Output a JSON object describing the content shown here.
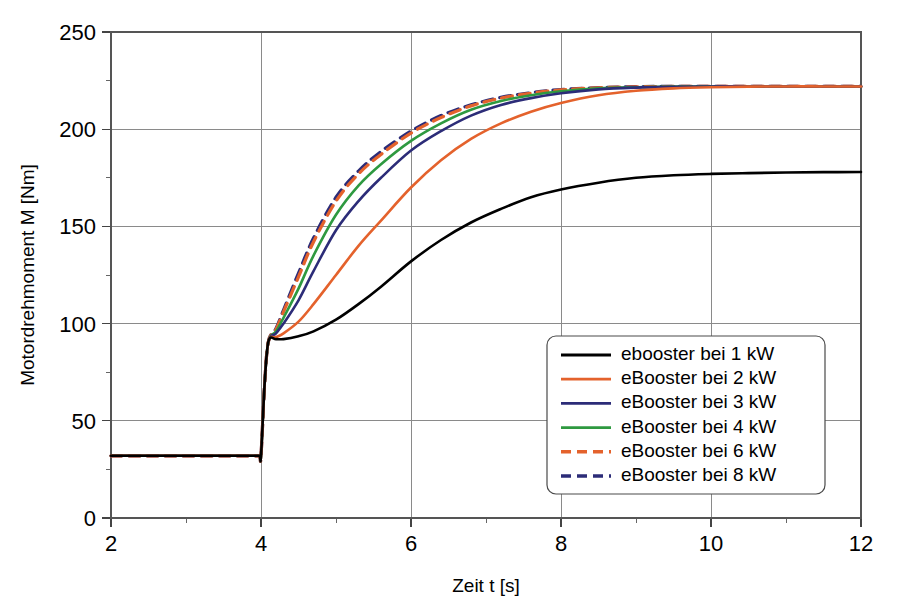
{
  "chart_data": {
    "type": "line",
    "title": "",
    "xlabel": "Zeit t [s]",
    "ylabel": "Motordrehmoment M [Nm]",
    "xlim": [
      2,
      12
    ],
    "ylim": [
      0,
      250
    ],
    "xticks": [
      "2",
      "4",
      "6",
      "8",
      "10",
      "12"
    ],
    "xtick_values": [
      2,
      4,
      6,
      8,
      10,
      12
    ],
    "xminor_values": [
      3,
      5,
      7,
      9,
      11
    ],
    "yticks": [
      "0",
      "50",
      "100",
      "150",
      "200",
      "250"
    ],
    "ytick_values": [
      0,
      50,
      100,
      150,
      200,
      250
    ],
    "yminor_values": [
      25,
      75,
      125,
      175,
      225
    ],
    "grid": true,
    "legend_position": "lower-right",
    "baseline_value": 32,
    "step_time": 4.0,
    "step_peak_value": 92,
    "series": [
      {
        "name": "ebooster bei 1 kW",
        "color": "#000000",
        "dash": "solid",
        "x": [
          2.0,
          2.5,
          3.0,
          3.5,
          3.9,
          3.98,
          4.0,
          4.05,
          4.1,
          4.2,
          4.3,
          4.5,
          4.7,
          5.0,
          5.3,
          5.6,
          6.0,
          6.4,
          6.8,
          7.2,
          7.6,
          8.0,
          8.5,
          9.0,
          9.5,
          10.0,
          10.5,
          11.0,
          11.5,
          12.0
        ],
        "y": [
          32,
          32,
          32,
          32,
          32,
          32,
          32,
          70,
          91,
          92,
          92,
          93.5,
          96,
          102,
          110,
          119,
          132,
          143,
          152,
          159,
          165,
          169,
          172.5,
          175,
          176.3,
          177,
          177.4,
          177.7,
          177.9,
          178
        ]
      },
      {
        "name": "eBooster bei 2 kW",
        "color": "#E4622C",
        "dash": "solid",
        "x": [
          2.0,
          2.5,
          3.0,
          3.5,
          3.9,
          3.98,
          4.0,
          4.05,
          4.1,
          4.2,
          4.3,
          4.5,
          4.7,
          5.0,
          5.3,
          5.6,
          6.0,
          6.4,
          6.8,
          7.2,
          7.6,
          8.0,
          8.5,
          9.0,
          9.5,
          10.0,
          10.5,
          11.0,
          11.5,
          12.0
        ],
        "y": [
          32,
          32,
          32,
          32,
          32,
          32,
          32,
          70,
          91,
          93,
          95,
          101,
          110,
          125,
          140,
          153,
          170,
          184,
          195,
          203,
          209,
          213.5,
          217.5,
          219.8,
          221,
          221.6,
          221.9,
          222,
          222,
          222
        ]
      },
      {
        "name": "eBooster bei 3 kW",
        "color": "#2C2C78",
        "dash": "solid",
        "x": [
          2.0,
          2.5,
          3.0,
          3.5,
          3.9,
          3.98,
          4.0,
          4.05,
          4.1,
          4.2,
          4.3,
          4.5,
          4.7,
          5.0,
          5.3,
          5.6,
          6.0,
          6.4,
          6.8,
          7.2,
          7.6,
          8.0,
          8.5,
          9.0,
          9.5,
          10.0,
          10.5,
          11.0,
          11.5,
          12.0
        ],
        "y": [
          32,
          32,
          32,
          32,
          32,
          32,
          32,
          70,
          91,
          95,
          100,
          112,
          127,
          148,
          163,
          175,
          189,
          199,
          207,
          212.5,
          216,
          218.5,
          220.5,
          221.4,
          221.8,
          222,
          222,
          222,
          222,
          222
        ]
      },
      {
        "name": "eBooster bei 4 kW",
        "color": "#2E9940",
        "dash": "solid",
        "x": [
          2.0,
          2.5,
          3.0,
          3.5,
          3.9,
          3.98,
          4.0,
          4.05,
          4.1,
          4.2,
          4.3,
          4.5,
          4.7,
          5.0,
          5.3,
          5.6,
          6.0,
          6.4,
          6.8,
          7.2,
          7.6,
          8.0,
          8.5,
          9.0,
          9.5,
          10.0,
          10.5,
          11.0,
          11.5,
          12.0
        ],
        "y": [
          32,
          32,
          32,
          32,
          32,
          32,
          32,
          70,
          91,
          96,
          103,
          118,
          135,
          156,
          171,
          182,
          194,
          203,
          210,
          214.5,
          217.5,
          219.5,
          221,
          221.6,
          221.9,
          222,
          222,
          222,
          222,
          222
        ]
      },
      {
        "name": "eBooster bei 6 kW",
        "color": "#E4622C",
        "dash": "dashed",
        "x": [
          2.0,
          2.5,
          3.0,
          3.5,
          3.9,
          3.98,
          4.0,
          4.05,
          4.1,
          4.2,
          4.3,
          4.5,
          4.7,
          5.0,
          5.3,
          5.6,
          6.0,
          6.4,
          6.8,
          7.2,
          7.6,
          8.0,
          8.5,
          9.0,
          9.5,
          10.0,
          10.5,
          11.0,
          11.5,
          12.0
        ],
        "y": [
          32,
          32,
          32,
          32,
          32,
          32,
          32,
          70,
          91,
          97,
          106,
          124,
          142,
          163,
          177,
          187,
          198,
          206,
          212,
          216,
          218.5,
          220.2,
          221.3,
          221.8,
          222,
          222,
          222,
          222,
          222,
          222
        ]
      },
      {
        "name": "eBooster bei 8 kW",
        "color": "#2C2C78",
        "dash": "dashed",
        "x": [
          2.0,
          2.5,
          3.0,
          3.5,
          3.9,
          3.98,
          4.0,
          4.05,
          4.1,
          4.2,
          4.3,
          4.5,
          4.7,
          5.0,
          5.3,
          5.6,
          6.0,
          6.4,
          6.8,
          7.2,
          7.6,
          8.0,
          8.5,
          9.0,
          9.5,
          10.0,
          10.5,
          11.0,
          11.5,
          12.0
        ],
        "y": [
          32,
          32,
          32,
          32,
          32,
          32,
          32,
          70,
          91,
          97.5,
          107,
          126,
          144,
          165,
          178.5,
          188.5,
          199,
          207,
          212.5,
          216.4,
          218.8,
          220.4,
          221.4,
          221.9,
          222,
          222,
          222,
          222,
          222,
          222
        ]
      }
    ]
  },
  "legend": {
    "items": [
      {
        "label": "ebooster bei 1 kW"
      },
      {
        "label": "eBooster bei 2 kW"
      },
      {
        "label": "eBooster bei 3 kW"
      },
      {
        "label": "eBooster bei 4 kW"
      },
      {
        "label": "eBooster bei 6 kW"
      },
      {
        "label": "eBooster bei 8 kW"
      }
    ]
  }
}
